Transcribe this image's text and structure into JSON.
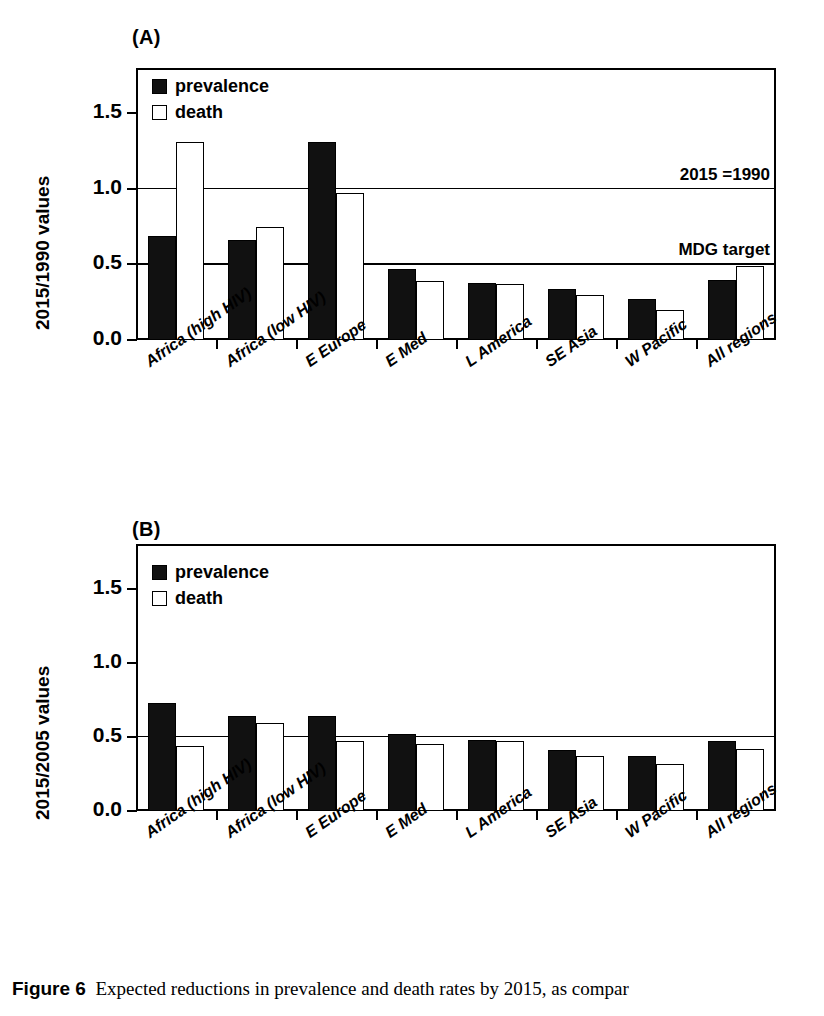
{
  "figure": {
    "caption_label": "Figure 6",
    "caption_text": "Expected reductions in prevalence and death rates by 2015, as compar"
  },
  "legend": {
    "prevalence_label": "prevalence",
    "death_label": "death"
  },
  "panels": [
    {
      "id": "A",
      "label": "(A)",
      "ylabel": "2015/1990 values",
      "yticks": [
        "0.0",
        "0.5",
        "1.0",
        "1.5"
      ],
      "annotations": [
        {
          "text": "2015 =1990",
          "value": 1.0
        },
        {
          "text": "MDG target",
          "value": 0.5
        }
      ]
    },
    {
      "id": "B",
      "label": "(B)",
      "ylabel": "2015/2005 values",
      "yticks": [
        "0.0",
        "0.5",
        "1.0",
        "1.5"
      ],
      "annotations": []
    }
  ],
  "chart_data": [
    {
      "type": "bar",
      "title": "(A)",
      "xlabel": "",
      "ylabel": "2015/1990 values",
      "ylim": [
        0.0,
        1.8
      ],
      "yticks": [
        0.0,
        0.5,
        1.0,
        1.5
      ],
      "grid": false,
      "legend_position": "top-left",
      "reference_lines": [
        {
          "value": 1.0,
          "label": "2015 =1990"
        },
        {
          "value": 0.5,
          "label": "MDG target"
        }
      ],
      "categories": [
        "Africa (high HIV)",
        "Africa (low HIV)",
        "E Europe",
        "E Med",
        "L America",
        "SE Asia",
        "W Pacific",
        "All regions"
      ],
      "series": [
        {
          "name": "prevalence",
          "values": [
            0.69,
            0.66,
            1.31,
            0.47,
            0.38,
            0.34,
            0.27,
            0.4
          ]
        },
        {
          "name": "death",
          "values": [
            1.31,
            0.75,
            0.97,
            0.39,
            0.37,
            0.3,
            0.2,
            0.49
          ]
        }
      ]
    },
    {
      "type": "bar",
      "title": "(B)",
      "xlabel": "",
      "ylabel": "2015/2005 values",
      "ylim": [
        0.0,
        1.8
      ],
      "yticks": [
        0.0,
        0.5,
        1.0,
        1.5
      ],
      "grid": false,
      "legend_position": "top-left",
      "reference_lines": [
        {
          "value": 0.5,
          "label": ""
        }
      ],
      "categories": [
        "Africa (high HIV)",
        "Africa (low HIV)",
        "E Europe",
        "E Med",
        "L America",
        "SE Asia",
        "W Pacific",
        "All regions"
      ],
      "series": [
        {
          "name": "prevalence",
          "values": [
            0.73,
            0.64,
            0.64,
            0.52,
            0.48,
            0.41,
            0.37,
            0.47
          ]
        },
        {
          "name": "death",
          "values": [
            0.44,
            0.59,
            0.47,
            0.45,
            0.47,
            0.37,
            0.32,
            0.42
          ]
        }
      ]
    }
  ]
}
